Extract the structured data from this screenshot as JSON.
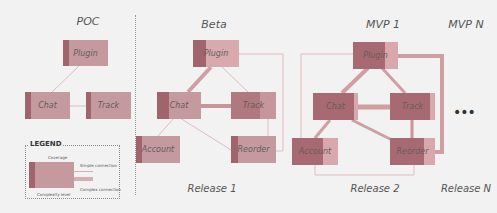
{
  "colors": {
    "background": "#f2f2f2",
    "node_fill": "#c49a9e",
    "node_complexity": "#a0646c",
    "node_coverage": "#e2a8ad",
    "line": "#d7aeb2",
    "line_complex": "#c99aa0",
    "divider": "#9a9a9a"
  },
  "stages": [
    {
      "title": "POC",
      "release": "",
      "nodes": [
        {
          "id": "plugin",
          "label": "Plugin"
        },
        {
          "id": "chat",
          "label": "Chat"
        },
        {
          "id": "track",
          "label": "Track"
        }
      ]
    },
    {
      "title": "Beta",
      "release": "Release 1",
      "nodes": [
        {
          "id": "plugin",
          "label": "Plugin"
        },
        {
          "id": "chat",
          "label": "Chat"
        },
        {
          "id": "track",
          "label": "Track"
        },
        {
          "id": "account",
          "label": "Account"
        },
        {
          "id": "reorder",
          "label": "Reorder"
        }
      ]
    },
    {
      "title": "MVP 1",
      "release": "Release 2",
      "nodes": [
        {
          "id": "plugin",
          "label": "Plugin"
        },
        {
          "id": "chat",
          "label": "Chat"
        },
        {
          "id": "track",
          "label": "Track"
        },
        {
          "id": "account",
          "label": "Account"
        },
        {
          "id": "reorder",
          "label": "Reorder"
        }
      ]
    },
    {
      "title": "MVP N",
      "release": "Release N",
      "nodes": [],
      "ellipsis": "•••"
    }
  ],
  "legend": {
    "title": "LEGEND",
    "coverage": "Coverage",
    "complexity": "Complexity level",
    "simple": "Simple connection",
    "complex": "Complex connection"
  }
}
